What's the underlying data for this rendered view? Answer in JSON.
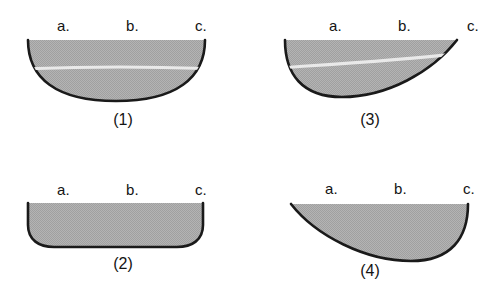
{
  "figure": {
    "background_color": "#ffffff",
    "fill_color": "#b0b0b0",
    "outline_color": "#1a1a1a",
    "highlight_line_color": "#e8e8e8",
    "zone_labels": [
      "a.",
      "b.",
      "c."
    ],
    "panels": [
      {
        "id": "panel-1",
        "caption": "(1)",
        "shape_name": "symmetric-round-bottom-hull",
        "has_highlight_line": true,
        "labels": [
          "a.",
          "b.",
          "c."
        ]
      },
      {
        "id": "panel-3",
        "caption": "(3)",
        "shape_name": "asymmetric-hull-deep-left-point-right",
        "has_highlight_line": true,
        "labels": [
          "a.",
          "b.",
          "c."
        ]
      },
      {
        "id": "panel-2",
        "caption": "(2)",
        "shape_name": "flat-bottom-rounded-corners-hull",
        "has_highlight_line": false,
        "labels": [
          "a.",
          "b.",
          "c."
        ]
      },
      {
        "id": "panel-4",
        "caption": "(4)",
        "shape_name": "asymmetric-hull-point-left-deep-right",
        "has_highlight_line": false,
        "labels": [
          "a.",
          "b.",
          "c."
        ]
      }
    ]
  }
}
